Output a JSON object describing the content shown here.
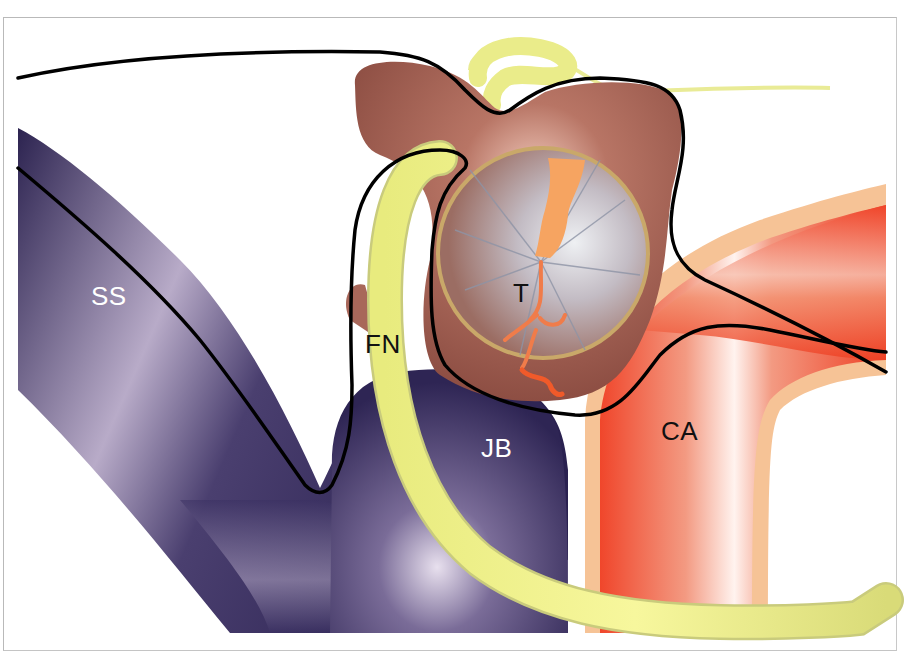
{
  "figure": {
    "type": "anatomical-illustration",
    "labels": [
      {
        "id": "SS",
        "text": "SS",
        "meaning_hint": "sigmoid sinus",
        "x": 91,
        "y": 283,
        "color": "#ffffff"
      },
      {
        "id": "FN",
        "text": "FN",
        "meaning_hint": "facial nerve",
        "x": 365,
        "y": 331,
        "color": "#111111"
      },
      {
        "id": "T",
        "text": "T",
        "meaning_hint": "tumor",
        "x": 513,
        "y": 280,
        "color": "#111111"
      },
      {
        "id": "JB",
        "text": "JB",
        "meaning_hint": "jugular bulb",
        "x": 481,
        "y": 435,
        "color": "#ffffff"
      },
      {
        "id": "CA",
        "text": "CA",
        "meaning_hint": "carotid artery",
        "x": 661,
        "y": 418,
        "color": "#111111"
      }
    ],
    "colors": {
      "sinus_dark": "#2e2552",
      "sinus_light": "#c9bfd6",
      "nerve": "#eef08a",
      "nerve_edge": "#c8c97a",
      "tumor_brown": "#9c5a4d",
      "tumor_highlight": "#f1c7b8",
      "tympanic_ring": "#c8a96a",
      "membrane": "#c7c3cc",
      "artery_red": "#f0452a",
      "artery_wall": "#f6c494",
      "outline": "#000000",
      "frame_border": "#b9b9b9"
    }
  }
}
